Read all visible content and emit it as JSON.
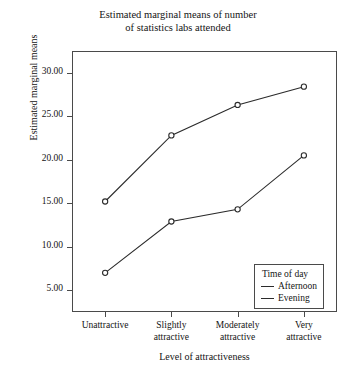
{
  "chart_data": {
    "type": "line",
    "title": "Estimated marginal means of number of statistics labs attended",
    "title_lines": [
      "Estimated marginal means of number",
      "of statistics labs attended"
    ],
    "xlabel": "Level of attractiveness",
    "ylabel": "Estimated marginal means",
    "categories": [
      "Unattractive",
      "Slightly attractive",
      "Moderately attractive",
      "Very attractive"
    ],
    "category_lines": [
      [
        "Unattractive"
      ],
      [
        "Slightly",
        "attractive"
      ],
      [
        "Moderately",
        "attractive"
      ],
      [
        "Very",
        "attractive"
      ]
    ],
    "series": [
      {
        "name": "Afternoon",
        "values": [
          15.2,
          22.8,
          26.3,
          28.4
        ],
        "color": "#2b2b2b"
      },
      {
        "name": "Evening",
        "values": [
          7.0,
          12.9,
          14.3,
          20.5
        ],
        "color": "#2b2b2b"
      }
    ],
    "ylim": [
      2.5,
      32.5
    ],
    "yticks": [
      30.0,
      25.0,
      20.0,
      15.0,
      10.0,
      5.0
    ],
    "ytick_labels": [
      "30.00",
      "25.00",
      "20.00",
      "15.00",
      "10.00",
      "5.00"
    ],
    "grid": false,
    "legend_position": "bottom-right",
    "legend_title": "Time of day",
    "marker": "open-circle",
    "frame": {
      "left": 72,
      "top": 51,
      "width": 265,
      "height": 261
    }
  }
}
